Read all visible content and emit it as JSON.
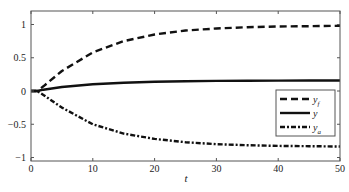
{
  "chart_data": {
    "type": "line",
    "title": "",
    "xlabel": "t",
    "ylabel": "",
    "xlim": [
      0,
      50
    ],
    "ylim": [
      -1,
      1.2
    ],
    "xticks": [
      0,
      10,
      20,
      30,
      40,
      50
    ],
    "yticks": [
      -1,
      -0.5,
      0,
      0.5,
      1
    ],
    "ytick_labels": [
      "−1",
      "−0.5",
      "0",
      "0.5",
      "1"
    ],
    "grid": false,
    "legend_position": "lower right",
    "x": [
      0,
      1,
      2,
      5,
      10,
      15,
      20,
      25,
      30,
      35,
      40,
      45,
      50
    ],
    "series": [
      {
        "name": "y_f",
        "label_main": "y",
        "label_sub": "f",
        "style": "dashed",
        "values": [
          0,
          0,
          0.07,
          0.3,
          0.58,
          0.75,
          0.85,
          0.91,
          0.94,
          0.96,
          0.97,
          0.975,
          0.98
        ]
      },
      {
        "name": "y",
        "label_main": "y",
        "label_sub": "",
        "style": "solid",
        "values": [
          0,
          0,
          0.02,
          0.06,
          0.1,
          0.125,
          0.14,
          0.148,
          0.152,
          0.155,
          0.157,
          0.158,
          0.158
        ]
      },
      {
        "name": "y_a",
        "label_main": "y",
        "label_sub": "a",
        "style": "dashdot",
        "values": [
          0,
          0,
          -0.06,
          -0.25,
          -0.5,
          -0.64,
          -0.72,
          -0.77,
          -0.8,
          -0.815,
          -0.825,
          -0.83,
          -0.835
        ]
      }
    ]
  }
}
